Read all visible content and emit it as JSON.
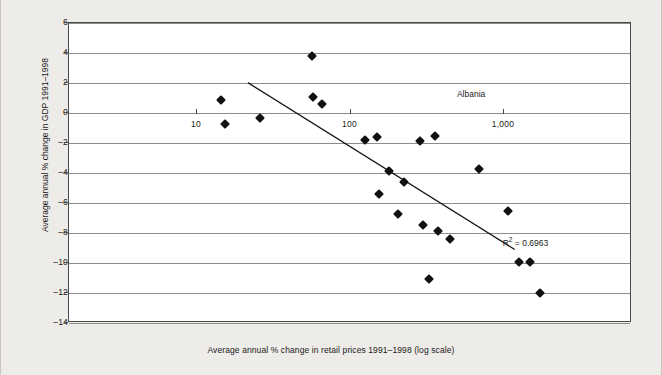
{
  "chart_data": {
    "type": "scatter",
    "title": "",
    "xlabel": "Average annual % change in retail prices 1991–1998 (log scale)",
    "ylabel": "Average annual % change in GDP 1991–1998",
    "x_scale": "log",
    "xlim": [
      5,
      3000
    ],
    "ylim": [
      -14,
      6
    ],
    "grid": true,
    "legend": false,
    "xticks": [
      {
        "value": 10,
        "label": "10"
      },
      {
        "value": 100,
        "label": "100"
      },
      {
        "value": 1000,
        "label": "1,000"
      }
    ],
    "yticks": [
      {
        "value": 6,
        "label": "6"
      },
      {
        "value": 4,
        "label": "4"
      },
      {
        "value": 2,
        "label": "2"
      },
      {
        "value": 0,
        "label": "0"
      },
      {
        "value": -2,
        "label": "–2"
      },
      {
        "value": -4,
        "label": "–4"
      },
      {
        "value": -6,
        "label": "–6"
      },
      {
        "value": -8,
        "label": "–8"
      },
      {
        "value": -10,
        "label": "–10"
      },
      {
        "value": -12,
        "label": "–12"
      },
      {
        "value": -14,
        "label": "–14"
      }
    ],
    "points": [
      {
        "x": 14.5,
        "y": 0.85
      },
      {
        "x": 15.5,
        "y": -0.75
      },
      {
        "x": 26,
        "y": -0.3
      },
      {
        "x": 57,
        "y": 3.8
      },
      {
        "x": 58,
        "y": 1.05
      },
      {
        "x": 66,
        "y": 0.6
      },
      {
        "x": 127,
        "y": -1.8
      },
      {
        "x": 152,
        "y": -1.6
      },
      {
        "x": 155,
        "y": -5.4
      },
      {
        "x": 182,
        "y": -3.85
      },
      {
        "x": 206,
        "y": -6.75
      },
      {
        "x": 228,
        "y": -4.6
      },
      {
        "x": 290,
        "y": -1.85
      },
      {
        "x": 300,
        "y": -7.45
      },
      {
        "x": 330,
        "y": -11.05
      },
      {
        "x": 363,
        "y": -1.5
      },
      {
        "x": 380,
        "y": -7.85
      },
      {
        "x": 452,
        "y": -8.4
      },
      {
        "x": 700,
        "y": -3.7
      },
      {
        "x": 1080,
        "y": -6.55
      },
      {
        "x": 1270,
        "y": -9.9
      },
      {
        "x": 1500,
        "y": -9.95
      },
      {
        "x": 1750,
        "y": -12.0
      }
    ],
    "trendline": {
      "x_start": 22,
      "y_start": 2.0,
      "x_end": 1220,
      "y_end": -9.2
    },
    "annotations": [
      {
        "name": "albania-label",
        "text": "Albania",
        "x": 620,
        "y": 1.3
      },
      {
        "name": "r-squared-label",
        "text": "R² = 0.6963",
        "x": 1400,
        "y": -8.5
      }
    ],
    "r_squared_prefix": "R",
    "r_squared_sup": "2",
    "r_squared_value": " = 0.6963"
  }
}
